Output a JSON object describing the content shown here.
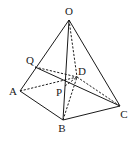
{
  "diagram": {
    "type": "3d-geometry-figure",
    "stroke_color": "#1a1a1a",
    "background": "#ffffff",
    "points": [
      {
        "id": "O",
        "label": "O",
        "x": 69,
        "y": 20,
        "lx": 69,
        "ly": 15,
        "anchor": "middle"
      },
      {
        "id": "A",
        "label": "A",
        "x": 20,
        "y": 91,
        "lx": 13,
        "ly": 95,
        "anchor": "middle"
      },
      {
        "id": "B",
        "label": "B",
        "x": 63,
        "y": 120,
        "lx": 62,
        "ly": 132,
        "anchor": "middle"
      },
      {
        "id": "C",
        "label": "C",
        "x": 120,
        "y": 106,
        "lx": 124,
        "ly": 118,
        "anchor": "middle"
      },
      {
        "id": "D",
        "label": "D",
        "x": 77,
        "y": 77,
        "lx": 82,
        "ly": 75,
        "anchor": "middle"
      },
      {
        "id": "Q",
        "label": "Q",
        "x": 35,
        "y": 67,
        "lx": 30,
        "ly": 64,
        "anchor": "middle"
      },
      {
        "id": "P",
        "label": "P",
        "x": 65,
        "y": 86,
        "lx": 59,
        "ly": 96,
        "anchor": "middle"
      }
    ],
    "edges": [
      {
        "from": "O",
        "to": "A",
        "style": "solid"
      },
      {
        "from": "O",
        "to": "B",
        "style": "solid"
      },
      {
        "from": "O",
        "to": "C",
        "style": "solid"
      },
      {
        "from": "O",
        "to": "D",
        "style": "dashed"
      },
      {
        "from": "A",
        "to": "B",
        "style": "solid"
      },
      {
        "from": "B",
        "to": "C",
        "style": "solid"
      },
      {
        "from": "A",
        "to": "D",
        "style": "dashed"
      },
      {
        "from": "D",
        "to": "C",
        "style": "dashed"
      },
      {
        "from": "B",
        "to": "D",
        "style": "dashed"
      },
      {
        "from": "Q",
        "to": "C",
        "style": "solid"
      },
      {
        "from": "Q",
        "to": "D",
        "style": "dashed"
      },
      {
        "from": "P",
        "to": "D",
        "style": "dashed"
      }
    ]
  }
}
